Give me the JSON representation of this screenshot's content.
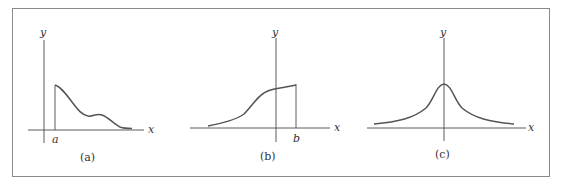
{
  "figure": {
    "panels": [
      {
        "id": "a",
        "caption": "(a)",
        "x_label": "x",
        "y_label": "y",
        "marker_label": "a",
        "description": "function defined for x >= a, starting at a maximum at x=a and decaying with a small bump toward zero"
      },
      {
        "id": "b",
        "caption": "(b)",
        "x_label": "x",
        "y_label": "y",
        "marker_label": "b",
        "description": "function defined for x <= b, rising from near zero on the left and ending at x=b"
      },
      {
        "id": "c",
        "caption": "(c)",
        "x_label": "x",
        "y_label": "y",
        "description": "symmetric bell-shaped curve peaked at x=0, decaying toward zero in both directions"
      }
    ],
    "colors": {
      "frame": "#8a8a8a",
      "axis": "#4a4a4a",
      "curve": "#555555",
      "text": "#333333"
    }
  }
}
